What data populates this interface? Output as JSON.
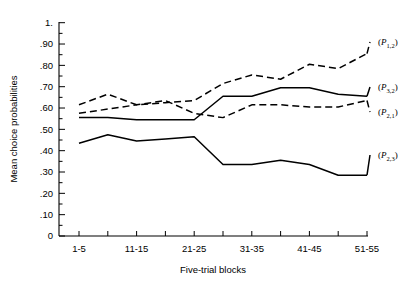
{
  "chart_data": {
    "type": "line",
    "title": "",
    "xlabel": "Five-trial blocks",
    "ylabel": "Mean choice probabilities",
    "ylim": [
      0,
      1.0
    ],
    "grid": false,
    "legend_position": "right-inline",
    "y_ticks": [
      "0",
      ".10",
      ".20",
      ".30",
      ".40",
      ".50",
      ".60",
      ".70",
      ".80",
      ".90",
      "1."
    ],
    "y_tick_values": [
      0,
      0.1,
      0.2,
      0.3,
      0.4,
      0.5,
      0.6,
      0.7,
      0.8,
      0.9,
      1.0
    ],
    "x_tick_labels": [
      "1-5",
      "11-15",
      "21-25",
      "31-35",
      "41-45",
      "51-55"
    ],
    "x_tick_label_blocks": [
      1,
      3,
      5,
      7,
      9,
      11
    ],
    "categories": [
      "1-5",
      "6-10",
      "11-15",
      "16-20",
      "21-25",
      "26-30",
      "31-35",
      "36-40",
      "41-45",
      "46-50",
      "51-55"
    ],
    "series": [
      {
        "name": "(P_1,2)",
        "label_base": "P",
        "label_sub": "1,2",
        "style": "dashed",
        "values": [
          0.615,
          0.665,
          0.615,
          0.625,
          0.635,
          0.715,
          0.755,
          0.735,
          0.805,
          0.785,
          0.855
        ]
      },
      {
        "name": "(P_3,2)",
        "label_base": "P",
        "label_sub": "3,2",
        "style": "solid",
        "values": [
          0.555,
          0.555,
          0.545,
          0.545,
          0.545,
          0.655,
          0.655,
          0.695,
          0.695,
          0.665,
          0.655
        ]
      },
      {
        "name": "(P_2,1)",
        "label_base": "P",
        "label_sub": "2,1",
        "style": "dashed",
        "values": [
          0.575,
          0.595,
          0.615,
          0.635,
          0.575,
          0.555,
          0.615,
          0.615,
          0.605,
          0.605,
          0.635
        ]
      },
      {
        "name": "(P_2,3)",
        "label_base": "P",
        "label_sub": "2,3",
        "style": "solid",
        "values": [
          0.435,
          0.475,
          0.445,
          0.455,
          0.465,
          0.335,
          0.335,
          0.355,
          0.335,
          0.285,
          0.285
        ]
      }
    ],
    "series_label_positions": [
      {
        "name": "(P_1,2)",
        "x": 378,
        "y": 45
      },
      {
        "name": "(P_3,2)",
        "x": 378,
        "y": 90
      },
      {
        "name": "(P_2,1)",
        "x": 378,
        "y": 115
      },
      {
        "name": "(P_2,3)",
        "x": 378,
        "y": 158
      }
    ]
  },
  "axis": {
    "x_title": "Five-trial blocks",
    "y_title": "Mean choice probabilities"
  }
}
